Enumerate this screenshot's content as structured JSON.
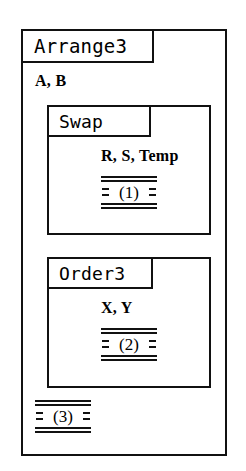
{
  "diagram": {
    "type": "nested-procedure-block-diagram",
    "caption": "",
    "outer": {
      "name": "Arrange3",
      "params": "A, B",
      "body_marker": {
        "label": "(3)",
        "left_dashes": "=",
        "right_dashes": "="
      }
    },
    "nested": [
      {
        "name": "Swap",
        "params": "R, S, Temp",
        "body_marker": {
          "label": "(1)",
          "left_dashes": "=",
          "right_dashes": "="
        }
      },
      {
        "name": "Order3",
        "params": "X, Y",
        "body_marker": {
          "label": "(2)",
          "left_dashes": "=",
          "right_dashes": "="
        }
      }
    ],
    "colors": {
      "ink": "#111111",
      "paper": "#ffffff"
    }
  }
}
